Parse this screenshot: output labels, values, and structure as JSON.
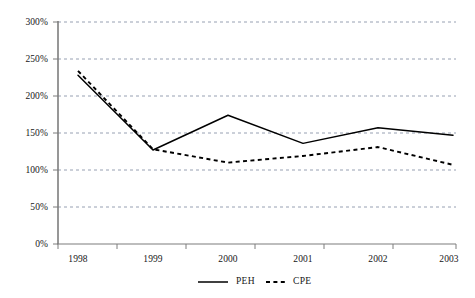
{
  "chart_data": {
    "type": "line",
    "title": "",
    "subtitle": "",
    "xlabel": "",
    "ylabel": "",
    "categories": [
      "1998",
      "1999",
      "2000",
      "2001",
      "2002",
      "2003"
    ],
    "x_tick_labels": [
      "1998",
      "1999",
      "2000",
      "2001",
      "2002",
      "2003"
    ],
    "y_tick_labels": [
      "0%",
      "50%",
      "100%",
      "150%",
      "200%",
      "250%",
      "300%"
    ],
    "y_tick_values": [
      0,
      50,
      100,
      150,
      200,
      250,
      300
    ],
    "ylim": [
      0,
      300
    ],
    "grid": true,
    "grid_style": "dashed-horizontal",
    "legend_position": "bottom-center",
    "series": [
      {
        "name": "PEH",
        "style": "solid",
        "color": "#000000",
        "values": [
          228,
          127,
          174,
          136,
          157,
          147
        ]
      },
      {
        "name": "CPE",
        "style": "dashed",
        "color": "#000000",
        "values": [
          234,
          128,
          110,
          119,
          131,
          107
        ]
      }
    ],
    "legend": [
      {
        "label": "PEH",
        "style": "solid"
      },
      {
        "label": "CPE",
        "style": "dashed"
      }
    ],
    "annotations": []
  },
  "axis": {
    "y_labels": [
      "300%",
      "250%",
      "200%",
      "150%",
      "100%",
      "50%",
      "0%"
    ],
    "x_labels": [
      "1998",
      "1999",
      "2000",
      "2001",
      "2002",
      "2003"
    ]
  },
  "legend": {
    "items": [
      {
        "label": "PEH"
      },
      {
        "label": "CPE"
      }
    ]
  },
  "colors": {
    "line": "#000000",
    "axis": "#666666",
    "grid": "#9aa0b0",
    "background": "#ffffff",
    "text": "#161616"
  }
}
